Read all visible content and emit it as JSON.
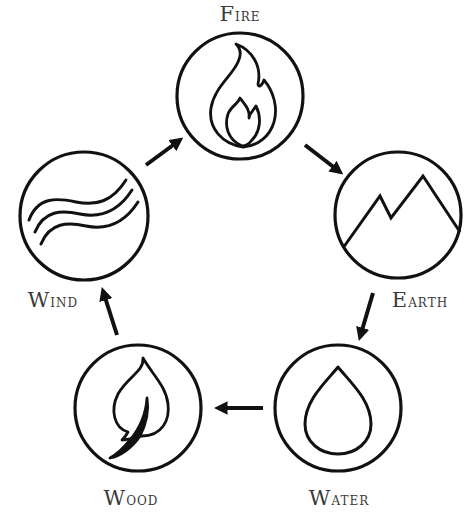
{
  "diagram": {
    "title": "",
    "colors": {
      "stroke": "#111111",
      "label": "#3a3a3a",
      "background": "#ffffff"
    },
    "nodes": [
      {
        "id": "fire",
        "label": "Fire",
        "icon": "flame-icon",
        "cx": 240,
        "cy": 96,
        "r": 63,
        "label_x": 240,
        "label_y": 4
      },
      {
        "id": "earth",
        "label": "Earth",
        "icon": "mountain-icon",
        "cx": 398,
        "cy": 215,
        "r": 63,
        "label_x": 420,
        "label_y": 290
      },
      {
        "id": "water",
        "label": "Water",
        "icon": "droplet-icon",
        "cx": 338,
        "cy": 408,
        "r": 63,
        "label_x": 339,
        "label_y": 488
      },
      {
        "id": "wood",
        "label": "Wood",
        "icon": "leaf-icon",
        "cx": 138,
        "cy": 408,
        "r": 63,
        "label_x": 131,
        "label_y": 488
      },
      {
        "id": "wind",
        "label": "Wind",
        "icon": "wind-icon",
        "cx": 84,
        "cy": 216,
        "r": 64,
        "label_x": 53,
        "label_y": 290
      }
    ],
    "edges": [
      {
        "from": "wind",
        "to": "fire",
        "x1": 146,
        "y1": 165,
        "x2": 180,
        "y2": 140
      },
      {
        "from": "fire",
        "to": "earth",
        "x1": 305,
        "y1": 145,
        "x2": 340,
        "y2": 172
      },
      {
        "from": "earth",
        "to": "water",
        "x1": 373,
        "y1": 293,
        "x2": 360,
        "y2": 337
      },
      {
        "from": "water",
        "to": "wood",
        "x1": 263,
        "y1": 408,
        "x2": 218,
        "y2": 408
      },
      {
        "from": "wood",
        "to": "wind",
        "x1": 117,
        "y1": 335,
        "x2": 103,
        "y2": 291
      }
    ]
  },
  "labels": {
    "fire": {
      "first": "F",
      "rest": "ire"
    },
    "earth": {
      "first": "E",
      "rest": "arth"
    },
    "water": {
      "first": "W",
      "rest": "ater"
    },
    "wood": {
      "first": "W",
      "rest": "ood"
    },
    "wind": {
      "first": "W",
      "rest": "ind"
    }
  }
}
